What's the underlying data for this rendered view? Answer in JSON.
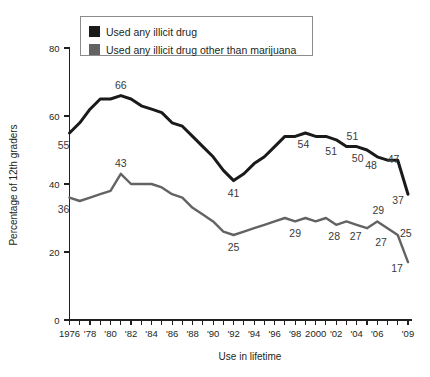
{
  "chart_data": {
    "type": "line",
    "title": "",
    "xlabel": "Use in lifetime",
    "ylabel": "Percentage of 12th graders",
    "xlim": [
      1976,
      2009
    ],
    "ylim": [
      0,
      80
    ],
    "yticks": [
      0,
      20,
      40,
      60,
      80
    ],
    "xtick_labels": [
      "1976",
      "'78",
      "'80",
      "'82",
      "'84",
      "'86",
      "'88",
      "'90",
      "'92",
      "'94",
      "'96",
      "'98",
      "2000",
      "'02",
      "'04",
      "'06",
      "'09"
    ],
    "xtick_years": [
      1976,
      1978,
      1980,
      1982,
      1984,
      1986,
      1988,
      1990,
      1992,
      1994,
      1996,
      1998,
      2000,
      2002,
      2004,
      2006,
      2009
    ],
    "grid": false,
    "legend_position": "top-left",
    "series": [
      {
        "name": "Used any illicit drug",
        "color": "#1a1a1a",
        "x": [
          1976,
          1977,
          1978,
          1979,
          1980,
          1981,
          1982,
          1983,
          1984,
          1985,
          1986,
          1987,
          1988,
          1989,
          1990,
          1991,
          1992,
          1993,
          1994,
          1995,
          1996,
          1997,
          1998,
          1999,
          2000,
          2001,
          2002,
          2003,
          2004,
          2005,
          2006,
          2007,
          2008,
          2009
        ],
        "values": [
          55,
          58,
          62,
          65,
          65,
          66,
          65,
          63,
          62,
          61,
          58,
          57,
          54,
          51,
          48,
          44,
          41,
          43,
          46,
          48,
          51,
          54,
          54,
          55,
          54,
          54,
          53,
          51,
          51,
          50,
          48,
          47,
          47,
          37
        ],
        "labels": [
          {
            "year": 1976,
            "value": 55,
            "text": "55",
            "dx": -6,
            "dy": 16,
            "anchor": "middle"
          },
          {
            "year": 1981,
            "value": 66,
            "text": "66",
            "dx": 0,
            "dy": -7,
            "anchor": "middle"
          },
          {
            "year": 1992,
            "value": 41,
            "text": "41",
            "dx": 0,
            "dy": 16,
            "anchor": "middle"
          },
          {
            "year": 1999,
            "value": 55,
            "text": "54",
            "dx": -2,
            "dy": 15,
            "anchor": "middle"
          },
          {
            "year": 2002,
            "value": 53,
            "text": "51",
            "dx": -5,
            "dy": 15,
            "anchor": "middle"
          },
          {
            "year": 2003,
            "value": 51,
            "text": "51",
            "dx": 6,
            "dy": -7,
            "anchor": "middle"
          },
          {
            "year": 2004,
            "value": 51,
            "text": "50",
            "dx": 1,
            "dy": 15,
            "anchor": "middle"
          },
          {
            "year": 2005,
            "value": 50,
            "text": "48",
            "dx": 4,
            "dy": 19,
            "anchor": "middle"
          },
          {
            "year": 2007,
            "value": 47,
            "text": "47",
            "dx": 6,
            "dy": 3,
            "anchor": "middle"
          },
          {
            "year": 2009,
            "value": 37,
            "text": "37",
            "dx": -10,
            "dy": 10,
            "anchor": "middle"
          }
        ]
      },
      {
        "name": "Used any illicit drug other than marijuana",
        "color": "#636363",
        "x": [
          1976,
          1977,
          1978,
          1979,
          1980,
          1981,
          1982,
          1983,
          1984,
          1985,
          1986,
          1987,
          1988,
          1989,
          1990,
          1991,
          1992,
          1993,
          1994,
          1995,
          1996,
          1997,
          1998,
          1999,
          2000,
          2001,
          2002,
          2003,
          2004,
          2005,
          2006,
          2007,
          2008,
          2009
        ],
        "values": [
          36,
          35,
          36,
          37,
          38,
          43,
          40,
          40,
          40,
          39,
          37,
          36,
          33,
          31,
          29,
          26,
          25,
          26,
          27,
          28,
          29,
          30,
          29,
          30,
          29,
          30,
          28,
          29,
          28,
          27,
          29,
          27,
          25,
          17
        ],
        "labels": [
          {
            "year": 1976,
            "value": 36,
            "text": "36",
            "dx": -6,
            "dy": 15,
            "anchor": "middle"
          },
          {
            "year": 1981,
            "value": 43,
            "text": "43",
            "dx": 0,
            "dy": -7,
            "anchor": "middle"
          },
          {
            "year": 1992,
            "value": 25,
            "text": "25",
            "dx": 0,
            "dy": 16,
            "anchor": "middle"
          },
          {
            "year": 1998,
            "value": 29,
            "text": "29",
            "dx": 0,
            "dy": 16,
            "anchor": "middle"
          },
          {
            "year": 2002,
            "value": 28,
            "text": "28",
            "dx": -2,
            "dy": 15,
            "anchor": "middle"
          },
          {
            "year": 2004,
            "value": 28,
            "text": "27",
            "dx": -1,
            "dy": 15,
            "anchor": "middle"
          },
          {
            "year": 2006,
            "value": 29,
            "text": "29",
            "dx": 1,
            "dy": -7,
            "anchor": "middle"
          },
          {
            "year": 2005,
            "value": 27,
            "text": "27",
            "dx": 14,
            "dy": 18,
            "anchor": "middle"
          },
          {
            "year": 2008,
            "value": 25,
            "text": "25",
            "dx": 8,
            "dy": 2,
            "anchor": "middle"
          },
          {
            "year": 2009,
            "value": 17,
            "text": "17",
            "dx": -11,
            "dy": 10,
            "anchor": "middle"
          }
        ]
      }
    ],
    "legend": [
      {
        "label": "Used any illicit drug",
        "color": "#1a1a1a"
      },
      {
        "label": "Used any illicit drug other than marijuana",
        "color": "#636363"
      }
    ]
  }
}
